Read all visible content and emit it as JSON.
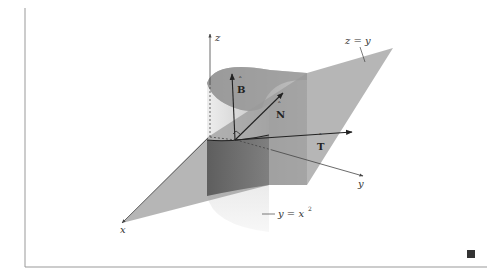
{
  "figure": {
    "axes": {
      "x_label": "x",
      "y_label": "y",
      "z_label": "z"
    },
    "vectors": [
      {
        "name": "T",
        "label": "T",
        "hat": true,
        "meaning": "unit tangent"
      },
      {
        "name": "N",
        "label": "N",
        "hat": true,
        "meaning": "unit normal"
      },
      {
        "name": "B",
        "label": "B",
        "hat": true,
        "meaning": "unit binormal"
      }
    ],
    "surfaces": [
      {
        "name": "plane",
        "label": "z = y"
      },
      {
        "name": "parabolic-cylinder",
        "label_main": "y = x",
        "label_exp": "2"
      }
    ],
    "end_of_proof_mark": "■"
  },
  "colors": {
    "plane_fill": "#9a9a9a",
    "cylinder_light": "#e6e6e6",
    "cylinder_dark": "#6a6a6a",
    "axis": "#444444",
    "vector": "#222222",
    "border": "#999999",
    "qed": "#333333"
  }
}
